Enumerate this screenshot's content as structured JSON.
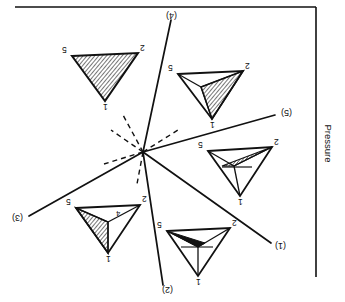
{
  "figure": {
    "kind": "phase-diagram",
    "axis_label": "Pressure",
    "orientation_note": "rotated-180",
    "line_color": "#111111",
    "hatch_color": "#111111",
    "background": "#ffffff"
  },
  "frame": {
    "top_rule": {
      "x1": 15,
      "y1": 7,
      "x2": 316,
      "y2": 7
    },
    "right_rule": {
      "x1": 316,
      "y1": 7,
      "x2": 316,
      "y2": 277
    }
  },
  "origin": {
    "x": 143,
    "y": 152,
    "label": "invariant-point"
  },
  "radiating_lines": [
    {
      "label": "(1)",
      "x2": 271,
      "y2": 243,
      "style": "solid",
      "label_x": 277,
      "label_y": 247
    },
    {
      "label": "(2)",
      "x2": 163,
      "y2": 285,
      "style": "solid",
      "label_x": 167,
      "label_y": 292
    },
    {
      "label": "(3)",
      "x2": 29,
      "y2": 216,
      "style": "solid",
      "label_x": 17,
      "label_y": 220
    },
    {
      "label": "(4)",
      "x2": 171,
      "y2": 20,
      "style": "solid",
      "label_x": 172,
      "label_y": 14
    },
    {
      "label": "(5)",
      "x2": 275,
      "y2": 115,
      "style": "solid",
      "label_x": 285,
      "label_y": 114
    }
  ],
  "dashed_lines": [
    {
      "x2": 106,
      "y2": 163
    },
    {
      "x2": 123,
      "y2": 117
    },
    {
      "x2": 137,
      "y2": 182
    },
    {
      "x2": 176,
      "y2": 132
    },
    {
      "x2": 112,
      "y2": 132
    }
  ],
  "triangles": [
    {
      "id": "tri-top-left",
      "vertices": {
        "v5": {
          "x": 72,
          "y": 56
        },
        "v2": {
          "x": 138,
          "y": 53
        },
        "v1": {
          "x": 105,
          "y": 101
        }
      },
      "labels": {
        "v5": "5",
        "v2": "2",
        "v1": "1"
      },
      "label_pos": {
        "v5": {
          "x": 64,
          "y": 51
        },
        "v2": {
          "x": 143,
          "y": 49
        },
        "v1": {
          "x": 105,
          "y": 108
        }
      },
      "fill": "full-hatch",
      "inner_point": null,
      "inner_label": null
    },
    {
      "id": "tri-top-right",
      "vertices": {
        "v5": {
          "x": 178,
          "y": 74
        },
        "v2": {
          "x": 243,
          "y": 71
        },
        "v1": {
          "x": 212,
          "y": 119
        }
      },
      "labels": {
        "v5": "5",
        "v2": "2",
        "v1": "1"
      },
      "label_pos": {
        "v5": {
          "x": 171,
          "y": 69
        },
        "v2": {
          "x": 249,
          "y": 67
        },
        "v1": {
          "x": 212,
          "y": 126
        }
      },
      "fill": "sub-hatch",
      "inner_point": {
        "x": 201,
        "y": 87
      },
      "inner_label": null,
      "hatch_region": [
        "v2",
        "v1",
        "inner"
      ]
    },
    {
      "id": "tri-mid-right",
      "vertices": {
        "v5": {
          "x": 208,
          "y": 151
        },
        "v2": {
          "x": 272,
          "y": 147
        },
        "v1": {
          "x": 240,
          "y": 196
        }
      },
      "labels": {
        "v5": "5",
        "v2": "2",
        "v1": "1"
      },
      "label_pos": {
        "v5": {
          "x": 201,
          "y": 146
        },
        "v2": {
          "x": 278,
          "y": 143
        },
        "v1": {
          "x": 240,
          "y": 203
        }
      },
      "fill": "sub-hatch-small",
      "inner_point": {
        "x": 234,
        "y": 166
      },
      "inner_label": null,
      "hatch_region": [
        "v2",
        "inner",
        "edge"
      ]
    },
    {
      "id": "tri-bottom-right",
      "vertices": {
        "v5": {
          "x": 167,
          "y": 231
        },
        "v2": {
          "x": 230,
          "y": 228
        },
        "v1": {
          "x": 198,
          "y": 276
        }
      },
      "labels": {
        "v5": "5",
        "v2": "2",
        "v1": "1"
      },
      "label_pos": {
        "v5": {
          "x": 160,
          "y": 226
        },
        "v2": {
          "x": 236,
          "y": 224
        },
        "v1": {
          "x": 198,
          "y": 283
        }
      },
      "fill": "sliver",
      "inner_point": {
        "x": 198,
        "y": 247
      },
      "inner_label": null,
      "hatch_region": [
        "v5",
        "inner",
        "sliver"
      ]
    },
    {
      "id": "tri-bottom-left",
      "vertices": {
        "v5": {
          "x": 76,
          "y": 208
        },
        "v2": {
          "x": 140,
          "y": 205
        },
        "v1": {
          "x": 108,
          "y": 253
        }
      },
      "labels": {
        "v5": "5",
        "v2": "2",
        "v1": "1",
        "inner": "4"
      },
      "label_pos": {
        "v5": {
          "x": 69,
          "y": 203
        },
        "v2": {
          "x": 146,
          "y": 201
        },
        "v1": {
          "x": 108,
          "y": 260
        },
        "inner": {
          "x": 118,
          "y": 216
        }
      },
      "fill": "sub-hatch-left",
      "inner_point": {
        "x": 108,
        "y": 222
      },
      "inner_label": "4",
      "hatch_region": [
        "v5",
        "v1",
        "inner"
      ]
    }
  ]
}
